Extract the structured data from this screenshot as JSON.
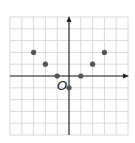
{
  "chart_data": {
    "type": "scatter",
    "title": "",
    "xlabel": "",
    "ylabel": "",
    "origin_label": "O",
    "xlim": [
      -5,
      5
    ],
    "ylim": [
      -5,
      5
    ],
    "grid": true,
    "grid_step": 1,
    "axes_arrows": true,
    "tick_labels": false,
    "series": [
      {
        "name": "points",
        "x": [
          -3,
          -2,
          -1,
          0,
          1,
          2,
          3
        ],
        "y": [
          2,
          1,
          0,
          -1,
          0,
          1,
          2
        ]
      }
    ],
    "colors": {
      "grid": "#cfcfcf",
      "axis": "#222222",
      "point": "#555555"
    }
  }
}
